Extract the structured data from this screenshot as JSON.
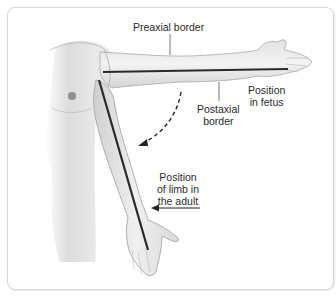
{
  "figure": {
    "labels": {
      "preaxial": "Preaxial border",
      "postaxial_line1": "Postaxial",
      "postaxial_line2": "border",
      "fetus_line1": "Position",
      "fetus_line2": "in fetus",
      "adult_line1": "Position",
      "adult_line2": "of limb in",
      "adult_line3": "the adult"
    },
    "colors": {
      "skin": "#ececec",
      "skin_shadow": "#c9c9c9",
      "outline": "#9a9a9a",
      "axis_line": "#2a2a2a",
      "text": "#2b2b2b",
      "frame_border": "#d6d6d6"
    }
  }
}
